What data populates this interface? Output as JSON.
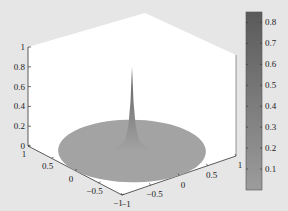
{
  "chart_data": {
    "type": "surface3d",
    "title": "",
    "xlabel": "",
    "ylabel": "",
    "zlabel": "",
    "xlim": [
      -1,
      1
    ],
    "ylim": [
      -1,
      1
    ],
    "zlim": [
      0,
      1
    ],
    "x_ticks": [
      "-1",
      "-0.5",
      "0",
      "0.5",
      "1"
    ],
    "y_ticks": [
      "1",
      "0.5",
      "0",
      "-0.5",
      "-1"
    ],
    "z_ticks": [
      "0",
      "0.2",
      "0.4",
      "0.6",
      "0.8",
      "1"
    ],
    "surface": {
      "domain": "disk",
      "radius": 1,
      "base_z": 0,
      "peak": {
        "x": 0,
        "y": 0,
        "z": 0.85
      },
      "profile": [
        {
          "r": 0.0,
          "z": 0.85
        },
        {
          "r": 0.02,
          "z": 0.5
        },
        {
          "r": 0.05,
          "z": 0.25
        },
        {
          "r": 0.1,
          "z": 0.1
        },
        {
          "r": 0.2,
          "z": 0.03
        },
        {
          "r": 0.35,
          "z": 0.0
        },
        {
          "r": 1.0,
          "z": 0.0
        }
      ]
    },
    "colorbar": {
      "placement": "right",
      "range": [
        0,
        0.85
      ],
      "ticks": [
        "0.1",
        "0.2",
        "0.3",
        "0.4",
        "0.5",
        "0.6",
        "0.7",
        "0.8"
      ],
      "tick_values": [
        0.1,
        0.2,
        0.3,
        0.4,
        0.5,
        0.6,
        0.7,
        0.8
      ],
      "color_low": "#9c9c9c",
      "color_high": "#5a5a5a"
    },
    "grid": false,
    "colors": {
      "background": "#e6e6e6",
      "axes_face": "#ffffff",
      "surface_base": "#a3a3a3",
      "axis_line": "#333333"
    }
  }
}
